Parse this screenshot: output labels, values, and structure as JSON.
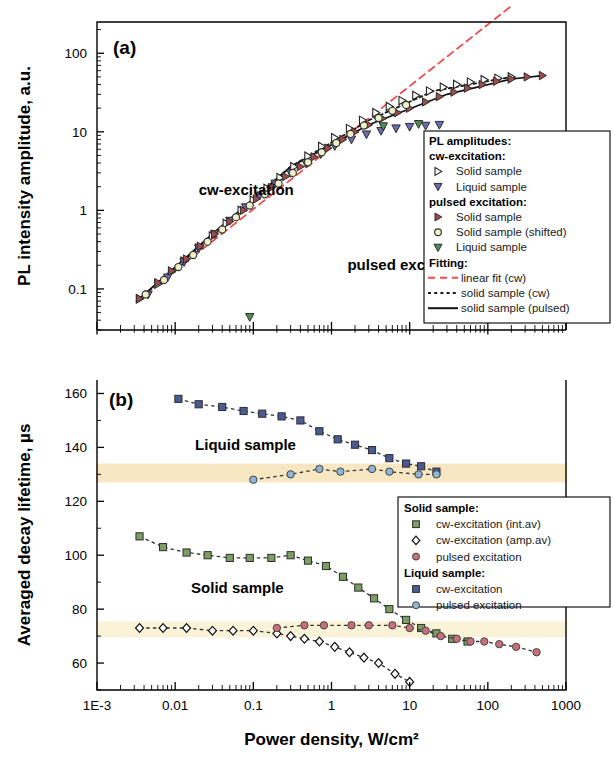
{
  "figure": {
    "xaxis": {
      "label": "Power density, W/cm²",
      "ticks": [
        "1E-3",
        "0.01",
        "0.1",
        "1",
        "10",
        "100",
        "1000"
      ],
      "min": 0.001,
      "max": 1000,
      "scale": "log"
    },
    "panel_a": {
      "tag": "(a)",
      "ylabel": "PL intensity amplitude, a.u.",
      "yticks": [
        "100",
        "10",
        "1",
        "0.1"
      ],
      "ymin": 0.03,
      "ymax": 250,
      "scale": "log",
      "annotations": [
        {
          "text": "cw-excitation",
          "x": 0.02,
          "y": 1.55
        },
        {
          "text": "pulsed excitation",
          "x": 1.6,
          "y": 0.175
        }
      ],
      "legend": {
        "title": "PL amplitudes:",
        "group1": "cw-excitation:",
        "group1_items": [
          {
            "label": "Solid sample",
            "marker": "right-triangle-open",
            "color": "#2b2b2b"
          },
          {
            "label": "Liquid sample",
            "marker": "down-triangle-filled",
            "color": "#6a6ab5"
          }
        ],
        "group2": "pulsed excitation:",
        "group2_items": [
          {
            "label": "Solid sample",
            "marker": "right-triangle-filled",
            "color": "#a34a4a"
          },
          {
            "label": "Solid sample (shifted)",
            "marker": "circle-open",
            "color": "#6b6b1e"
          },
          {
            "label": "Liquid sample",
            "marker": "down-triangle-filled",
            "color": "#4f8f52"
          }
        ],
        "group3": "Fitting:",
        "group3_items": [
          {
            "label": "linear fit (cw)",
            "line": "dashed",
            "color": "#ef4d4d"
          },
          {
            "label": "solid sample (cw)",
            "line": "dotted",
            "color": "#1a1a1a"
          },
          {
            "label": "solid sample (pulsed)",
            "line": "solid",
            "color": "#111111"
          }
        ]
      }
    },
    "panel_b": {
      "tag": "(b)",
      "ylabel": "Averaged decay lifetime, µs",
      "yticks": [
        "160",
        "140",
        "120",
        "100",
        "80",
        "60"
      ],
      "ymin": 50,
      "ymax": 165,
      "scale": "linear",
      "annotations": [
        {
          "text": "Liquid sample",
          "x": 0.018,
          "y": 139
        },
        {
          "text": "Solid sample",
          "x": 0.016,
          "y": 86
        }
      ],
      "bands": [
        {
          "from": 127,
          "to": 134,
          "color": "#f7e7c3"
        },
        {
          "from": 69.5,
          "to": 75.5,
          "color": "#fbf3d8"
        }
      ],
      "legend": {
        "group1": "Solid sample:",
        "group1_items": [
          {
            "label": "cw-excitation (int.av)",
            "marker": "square-filled",
            "color": "#7d9e63"
          },
          {
            "label": "cw-excitation (amp.av)",
            "marker": "diamond-open",
            "color": "#141414"
          },
          {
            "label": "pulsed excitation",
            "marker": "circle-filled",
            "color": "#c8707a"
          }
        ],
        "group2": "Liquid sample:",
        "group2_items": [
          {
            "label": "cw-excitation",
            "marker": "square-filled",
            "color": "#495b91"
          },
          {
            "label": "pulsed excitation",
            "marker": "circle-filled",
            "color": "#8fb6d4"
          }
        ]
      }
    }
  },
  "chart_data": [
    {
      "type": "scatter",
      "title": "(a) PL intensity amplitude vs power density",
      "xlabel": "Power density, W/cm²",
      "ylabel": "PL intensity amplitude, a.u.",
      "xscale": "log",
      "yscale": "log",
      "xlim": [
        0.001,
        1000
      ],
      "ylim": [
        0.03,
        250
      ],
      "grid": false,
      "legend_position": "right-middle",
      "series": [
        {
          "name": "cw-excitation Solid sample",
          "marker": "right-triangle-open",
          "color": "#2b2b2b",
          "x": [
            0.0035,
            0.006,
            0.009,
            0.013,
            0.02,
            0.03,
            0.045,
            0.07,
            0.1,
            0.15,
            0.22,
            0.33,
            0.5,
            0.75,
            1.1,
            1.7,
            2.5,
            3.7,
            5.5,
            8,
            12,
            18,
            27,
            40,
            60,
            90,
            135,
            200
          ],
          "y": [
            0.075,
            0.115,
            0.165,
            0.225,
            0.33,
            0.47,
            0.68,
            1.0,
            1.35,
            1.9,
            2.6,
            3.6,
            4.9,
            6.5,
            8.4,
            11,
            14,
            17.5,
            21,
            25,
            29,
            33,
            37,
            40,
            43,
            46,
            48,
            50
          ]
        },
        {
          "name": "cw-excitation Liquid sample",
          "marker": "down-triangle-filled",
          "color": "#6a6ab5",
          "x": [
            0.0045,
            0.008,
            0.013,
            0.02,
            0.032,
            0.05,
            0.08,
            0.12,
            0.19,
            0.3,
            0.47,
            0.73,
            1.1,
            1.8,
            2.8,
            4.3,
            6.7,
            10,
            16,
            24
          ],
          "y": [
            0.085,
            0.14,
            0.22,
            0.33,
            0.5,
            0.74,
            1.1,
            1.55,
            2.2,
            3.0,
            4.0,
            5.2,
            6.6,
            8.0,
            9.3,
            10.3,
            11.1,
            11.6,
            12.0,
            12.3
          ]
        },
        {
          "name": "pulsed excitation Solid sample",
          "marker": "right-triangle-filled",
          "color": "#a34a4a",
          "x": [
            0.0035,
            0.006,
            0.009,
            0.014,
            0.021,
            0.032,
            0.05,
            0.075,
            0.11,
            0.17,
            0.26,
            0.4,
            0.6,
            0.9,
            1.4,
            2.0,
            3.0,
            4.5,
            7,
            10,
            16,
            24,
            37,
            55,
            85,
            130,
            200,
            320,
            500
          ],
          "y": [
            0.075,
            0.12,
            0.17,
            0.24,
            0.35,
            0.5,
            0.72,
            1.0,
            1.4,
            1.95,
            2.7,
            3.6,
            4.8,
            6.2,
            8.0,
            10.0,
            12.3,
            14.8,
            17.5,
            20,
            24,
            28,
            32,
            36,
            40,
            44,
            47,
            50,
            52
          ]
        },
        {
          "name": "pulsed excitation Solid sample (shifted)",
          "marker": "circle-open",
          "color": "#6b6b1e",
          "x": [
            0.0042,
            0.0072,
            0.011,
            0.017,
            0.026,
            0.04,
            0.06,
            0.09,
            0.14,
            0.21,
            0.32,
            0.5,
            0.75,
            1.15,
            1.75,
            2.6,
            4.0,
            6.0,
            9.0
          ],
          "y": [
            0.085,
            0.13,
            0.19,
            0.27,
            0.4,
            0.57,
            0.82,
            1.15,
            1.6,
            2.2,
            3.0,
            4.1,
            5.5,
            7.2,
            9.4,
            12,
            15,
            18.5,
            22
          ]
        },
        {
          "name": "pulsed excitation Liquid sample",
          "marker": "down-triangle-filled",
          "color": "#4f8f52",
          "x": [
            0.09,
            4.6,
            13
          ],
          "y": [
            0.044,
            11.8,
            12.6
          ]
        },
        {
          "name": "linear fit (cw)",
          "type": "line",
          "line": "dashed",
          "color": "#ef4d4d",
          "x": [
            0.0032,
            200
          ],
          "y": [
            0.07,
            400
          ]
        },
        {
          "name": "solid sample (cw) fit",
          "type": "line",
          "line": "dotted",
          "color": "#1a1a1a",
          "x": [
            0.0035,
            0.03,
            0.3,
            3,
            20,
            200
          ],
          "y": [
            0.075,
            0.47,
            3.6,
            14,
            33,
            50
          ]
        },
        {
          "name": "solid sample (pulsed) fit",
          "type": "line",
          "line": "solid",
          "color": "#111111",
          "x": [
            0.0035,
            0.03,
            0.3,
            3,
            30,
            200,
            500
          ],
          "y": [
            0.075,
            0.5,
            3.6,
            12.3,
            30,
            47,
            52
          ]
        }
      ]
    },
    {
      "type": "scatter",
      "title": "(b) Averaged decay lifetime vs power density",
      "xlabel": "Power density, W/cm²",
      "ylabel": "Averaged decay lifetime, µs",
      "xscale": "log",
      "yscale": "linear",
      "xlim": [
        0.001,
        1000
      ],
      "ylim": [
        50,
        165
      ],
      "grid": false,
      "legend_position": "right-lower",
      "series": [
        {
          "name": "Liquid sample cw-excitation",
          "marker": "square-filled",
          "color": "#495b91",
          "x": [
            0.011,
            0.02,
            0.04,
            0.075,
            0.13,
            0.23,
            0.4,
            0.7,
            1.2,
            2.0,
            3.3,
            5.5,
            9,
            14,
            22
          ],
          "y": [
            158,
            156,
            155,
            153.5,
            152.5,
            151.5,
            150,
            146,
            143,
            141,
            139,
            136,
            134,
            133,
            131
          ]
        },
        {
          "name": "Liquid sample pulsed excitation",
          "marker": "circle-filled",
          "color": "#8fb6d4",
          "x": [
            0.1,
            0.3,
            0.7,
            1.3,
            3.3,
            5.5,
            13,
            22
          ],
          "y": [
            128,
            130,
            132,
            131,
            132,
            131,
            130,
            130
          ]
        },
        {
          "name": "Solid sample cw-excitation (int.av)",
          "marker": "square-filled",
          "color": "#7d9e63",
          "x": [
            0.0035,
            0.007,
            0.014,
            0.026,
            0.05,
            0.09,
            0.17,
            0.3,
            0.5,
            0.85,
            1.4,
            2.2,
            3.5,
            5.5,
            9,
            14,
            22,
            35,
            55
          ],
          "y": [
            107,
            103,
            101,
            100,
            99,
            99,
            99,
            100,
            98,
            96,
            92,
            88,
            84,
            80,
            76,
            73,
            71,
            69,
            68
          ]
        },
        {
          "name": "Solid sample cw-excitation (amp.av)",
          "marker": "diamond-open",
          "color": "#141414",
          "x": [
            0.0035,
            0.007,
            0.014,
            0.03,
            0.055,
            0.1,
            0.2,
            0.3,
            0.45,
            0.7,
            1.1,
            1.7,
            2.6,
            4.0,
            6.5,
            10
          ],
          "y": [
            73,
            73,
            73,
            72,
            72,
            72,
            71,
            70,
            69,
            68,
            66,
            64,
            62,
            60,
            56,
            53
          ]
        },
        {
          "name": "Solid sample pulsed excitation",
          "marker": "circle-filled",
          "color": "#c8707a",
          "x": [
            0.2,
            0.45,
            0.8,
            1.8,
            3.0,
            6.0,
            10,
            16,
            25,
            40,
            60,
            90,
            140,
            230,
            420
          ],
          "y": [
            73,
            74,
            74,
            74,
            74,
            74,
            73,
            72,
            70,
            69,
            68,
            68,
            67,
            66,
            64
          ]
        }
      ]
    }
  ]
}
